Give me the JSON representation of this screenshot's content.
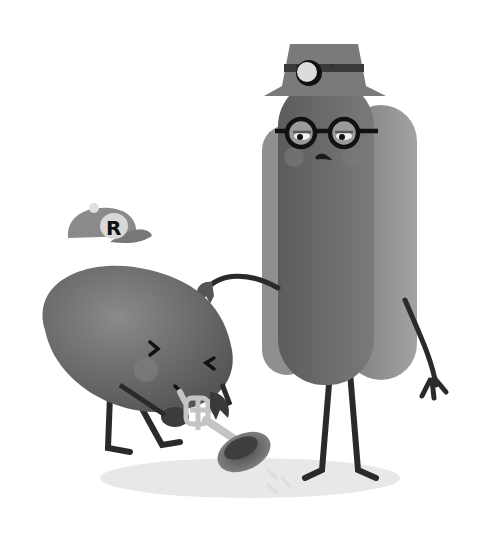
{
  "illustration": {
    "style": "grayscale cartoon",
    "characters": [
      {
        "name": "bean",
        "accessories": [
          "baseball cap",
          "trumpet"
        ],
        "cap_letter": "R",
        "expression": "eyes squeezed shut"
      },
      {
        "name": "hot dog",
        "accessories": [
          "fedora hat",
          "headlamp",
          "round glasses"
        ],
        "expression": "worried"
      }
    ]
  },
  "colors": {
    "background": "#ffffff",
    "bean": "#6f6f6f",
    "bun": "#8c8c8c",
    "sausage": "#666666",
    "hat": "#7a7a7a",
    "cap": "#8a8a8a",
    "trumpet": "#bdbdbd",
    "ground": "#e6e6e6",
    "lines": "#1e1e1e"
  }
}
